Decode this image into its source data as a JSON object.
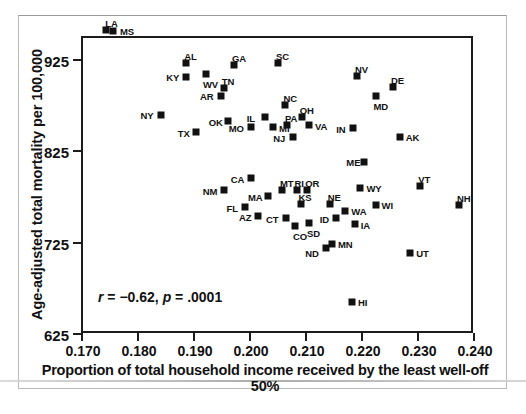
{
  "chart_data": {
    "type": "scatter",
    "title": "",
    "xlabel": "Proportion of total household income received by the least well-off 50%",
    "ylabel": "Age-adjusted total mortality per 100,000",
    "xlim": [
      0.17,
      0.24
    ],
    "ylim": [
      625,
      950
    ],
    "xticks": [
      "0.170",
      "0.180",
      "0.190",
      "0.200",
      "0.210",
      "0.220",
      "0.230",
      "0.240"
    ],
    "xtick_values": [
      0.17,
      0.18,
      0.19,
      0.2,
      0.21,
      0.22,
      0.23,
      0.24
    ],
    "yticks": [
      "925",
      "825",
      "725",
      "625"
    ],
    "ytick_values": [
      925,
      825,
      725,
      625
    ],
    "grid": false,
    "legend": null,
    "annotation": "r = −0.62, p = .0001",
    "annotation_r": "r",
    "annotation_r_value": " = −0.62, ",
    "annotation_p": "p",
    "annotation_p_value": " = .0001",
    "marker_color": "#111111",
    "marker_shape": "square",
    "point_label_field": "state",
    "points": [
      {
        "state": "LA",
        "x": 0.1745,
        "y": 957,
        "lx": -1,
        "ly": -11
      },
      {
        "state": "MS",
        "x": 0.1757,
        "y": 955,
        "lx": 7,
        "ly": -4
      },
      {
        "state": "AL",
        "x": 0.1888,
        "y": 920,
        "lx": -2,
        "ly": -11
      },
      {
        "state": "KY",
        "x": 0.1888,
        "y": 905,
        "lx": -20,
        "ly": -4
      },
      {
        "state": "WV",
        "x": 0.1923,
        "y": 908,
        "lx": -3,
        "ly": 6
      },
      {
        "state": "GA",
        "x": 0.1973,
        "y": 918,
        "lx": -2,
        "ly": -11
      },
      {
        "state": "TN",
        "x": 0.1955,
        "y": 893,
        "lx": -2,
        "ly": -11
      },
      {
        "state": "AR",
        "x": 0.195,
        "y": 884,
        "lx": -21,
        "ly": -4
      },
      {
        "state": "SC",
        "x": 0.2052,
        "y": 921,
        "lx": -2,
        "ly": -11
      },
      {
        "state": "NV",
        "x": 0.2193,
        "y": 906,
        "lx": -2,
        "ly": -11
      },
      {
        "state": "DE",
        "x": 0.2257,
        "y": 894,
        "lx": -2,
        "ly": -11
      },
      {
        "state": "MD",
        "x": 0.2226,
        "y": 884,
        "lx": -2,
        "ly": 6
      },
      {
        "state": "NY",
        "x": 0.1842,
        "y": 864,
        "lx": -20,
        "ly": -4
      },
      {
        "state": "NC",
        "x": 0.2065,
        "y": 874,
        "lx": -2,
        "ly": -11
      },
      {
        "state": "IL",
        "x": 0.2028,
        "y": 861,
        "lx": -18,
        "ly": -3
      },
      {
        "state": "OH",
        "x": 0.2094,
        "y": 861,
        "lx": -2,
        "ly": -11
      },
      {
        "state": "PA",
        "x": 0.2068,
        "y": 853,
        "lx": -2,
        "ly": -11
      },
      {
        "state": "VA",
        "x": 0.2107,
        "y": 853,
        "lx": 6,
        "ly": -3
      },
      {
        "state": "MO",
        "x": 0.2003,
        "y": 850,
        "lx": -22,
        "ly": -3
      },
      {
        "state": "MI",
        "x": 0.2043,
        "y": 850,
        "lx": 6,
        "ly": -3
      },
      {
        "state": "IN",
        "x": 0.2186,
        "y": 849,
        "lx": -17,
        "ly": -3
      },
      {
        "state": "OK",
        "x": 0.1962,
        "y": 857,
        "lx": -19,
        "ly": -3
      },
      {
        "state": "TX",
        "x": 0.1905,
        "y": 845,
        "lx": -18,
        "ly": -3
      },
      {
        "state": "NJ",
        "x": 0.2079,
        "y": 840,
        "lx": -20,
        "ly": -3
      },
      {
        "state": "AK",
        "x": 0.2269,
        "y": 840,
        "lx": 6,
        "ly": -4
      },
      {
        "state": "ME",
        "x": 0.2206,
        "y": 812,
        "lx": -18,
        "ly": -4
      },
      {
        "state": "VT",
        "x": 0.2306,
        "y": 786,
        "lx": -2,
        "ly": -11
      },
      {
        "state": "CA",
        "x": 0.2003,
        "y": 795,
        "lx": -20,
        "ly": -3
      },
      {
        "state": "NM",
        "x": 0.1955,
        "y": 782,
        "lx": -21,
        "ly": -3
      },
      {
        "state": "MT",
        "x": 0.2059,
        "y": 782,
        "lx": -2,
        "ly": -11
      },
      {
        "state": "RI",
        "x": 0.2085,
        "y": 782,
        "lx": -2,
        "ly": -11
      },
      {
        "state": "OR",
        "x": 0.2104,
        "y": 782,
        "lx": -2,
        "ly": -11
      },
      {
        "state": "WY",
        "x": 0.2199,
        "y": 784,
        "lx": 6,
        "ly": -4
      },
      {
        "state": "MA",
        "x": 0.2034,
        "y": 775,
        "lx": -20,
        "ly": -3
      },
      {
        "state": "NH",
        "x": 0.2375,
        "y": 765,
        "lx": -2,
        "ly": -11
      },
      {
        "state": "KS",
        "x": 0.2092,
        "y": 766,
        "lx": -2,
        "ly": -11
      },
      {
        "state": "NE",
        "x": 0.2144,
        "y": 766,
        "lx": -2,
        "ly": -11
      },
      {
        "state": "WA",
        "x": 0.2172,
        "y": 758,
        "lx": 6,
        "ly": -4
      },
      {
        "state": "WI",
        "x": 0.2226,
        "y": 765,
        "lx": 6,
        "ly": -4
      },
      {
        "state": "FL",
        "x": 0.1992,
        "y": 763,
        "lx": -18,
        "ly": -3
      },
      {
        "state": "AZ",
        "x": 0.2016,
        "y": 753,
        "lx": -19,
        "ly": -3
      },
      {
        "state": "CT",
        "x": 0.2066,
        "y": 751,
        "lx": -20,
        "ly": -3
      },
      {
        "state": "ID",
        "x": 0.2155,
        "y": 751,
        "lx": -16,
        "ly": -3
      },
      {
        "state": "CO",
        "x": 0.2082,
        "y": 742,
        "lx": -2,
        "ly": 6
      },
      {
        "state": "SD",
        "x": 0.2107,
        "y": 745,
        "lx": -2,
        "ly": 6
      },
      {
        "state": "IA",
        "x": 0.2189,
        "y": 744,
        "lx": 6,
        "ly": -3
      },
      {
        "state": "MN",
        "x": 0.2148,
        "y": 722,
        "lx": 6,
        "ly": -4
      },
      {
        "state": "ND",
        "x": 0.2138,
        "y": 718,
        "lx": -21,
        "ly": 1
      },
      {
        "state": "UT",
        "x": 0.2288,
        "y": 712,
        "lx": 6,
        "ly": -4
      },
      {
        "state": "HI",
        "x": 0.2184,
        "y": 659,
        "lx": 6,
        "ly": -4
      }
    ]
  }
}
